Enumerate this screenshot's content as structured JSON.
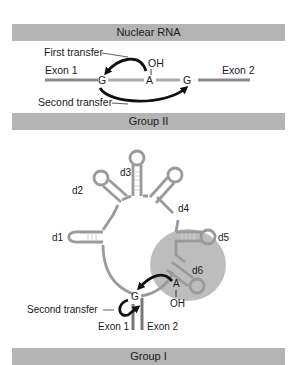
{
  "panels": {
    "nuclear": {
      "title": "Nuclear RNA",
      "labels": {
        "first_transfer": "First transfer",
        "second_transfer": "Second transfer",
        "exon1": "Exon 1",
        "exon2": "Exon 2",
        "g_left": "G",
        "a_branch": "A",
        "g_right": "G",
        "oh": "OH"
      }
    },
    "group2": {
      "title": "Group II",
      "domains": [
        "d1",
        "d2",
        "d3",
        "d4",
        "d5",
        "d6"
      ],
      "labels": {
        "second_transfer": "Second transfer",
        "exon1": "Exon 1",
        "exon2": "Exon 2",
        "g": "G",
        "a_branch": "A",
        "oh": "OH"
      }
    },
    "group1": {
      "title": "Group I"
    }
  },
  "colors": {
    "banner": "#b4b4b4",
    "exon": "#8a8a8a",
    "intron": "#a8a8a8",
    "rna_outline": "#9a9a9a",
    "highlight_blob": "#bdbdbd",
    "arrow": "#111111"
  }
}
